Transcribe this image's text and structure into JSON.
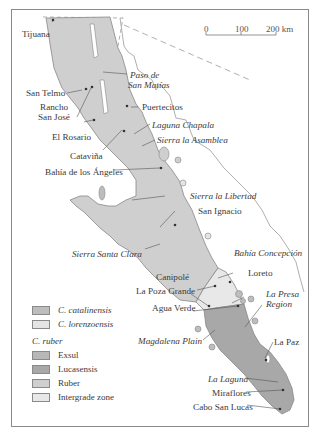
{
  "map": {
    "scale_bar": {
      "ticks": [
        "0",
        "100",
        "200 km"
      ]
    },
    "colors": {
      "catalinensis": "#bdbdbd",
      "lorenzoensis": "#e4e4e4",
      "exsul": "#b7b7b7",
      "lucasensis": "#a8a8a8",
      "ruber": "#cfcfcf",
      "intergrade": "#e8e8e8",
      "land_other": "#ffffff",
      "outline": "#888888"
    },
    "place_labels": [
      {
        "id": "tijuana",
        "text": "Tijuana",
        "italic": false
      },
      {
        "id": "paso-de-san-matias",
        "text": "Paso de San Matías",
        "line1": "Paso de",
        "line2": "San Matías",
        "italic": true
      },
      {
        "id": "san-telmo",
        "text": "San Telmo",
        "italic": false
      },
      {
        "id": "rancho-san-jose",
        "text": "Rancho San José",
        "line1": "Rancho",
        "line2": "San José",
        "italic": false
      },
      {
        "id": "puertecitos",
        "text": "Puertecitos",
        "italic": false
      },
      {
        "id": "laguna-chapala",
        "text": "Laguna Chapala",
        "italic": true
      },
      {
        "id": "el-rosario",
        "text": "El Rosario",
        "italic": false
      },
      {
        "id": "sierra-la-asamblea",
        "text": "Sierra la Asamblea",
        "italic": true
      },
      {
        "id": "catavina",
        "text": "Cataviña",
        "italic": false
      },
      {
        "id": "bahia-de-los-angeles",
        "text": "Bahía de los Ángeles",
        "italic": false
      },
      {
        "id": "sierra-la-libertad",
        "text": "Sierra la Libertad",
        "italic": true
      },
      {
        "id": "san-ignacio",
        "text": "San Ignacio",
        "italic": false
      },
      {
        "id": "sierra-santa-clara",
        "text": "Sierra Santa Clara",
        "italic": true
      },
      {
        "id": "bahia-concepcion",
        "text": "Bahía Concepción",
        "italic": true
      },
      {
        "id": "canipole",
        "text": "Canipolé",
        "italic": false
      },
      {
        "id": "loreto",
        "text": "Loreto",
        "italic": false
      },
      {
        "id": "la-poza-grande",
        "text": "La Poza Grande",
        "italic": false
      },
      {
        "id": "la-presa-region",
        "text": "La Presa Region",
        "line1": "La Presa",
        "line2": "Region",
        "italic": true
      },
      {
        "id": "agua-verde",
        "text": "Agua Verde",
        "italic": false
      },
      {
        "id": "magdalena-plain",
        "text": "Magdalena Plain",
        "italic": true
      },
      {
        "id": "la-paz",
        "text": "La Paz",
        "italic": false
      },
      {
        "id": "la-laguna",
        "text": "La Laguna",
        "italic": true
      },
      {
        "id": "miraflores",
        "text": "Miraflores",
        "italic": false
      },
      {
        "id": "cabo-san-lucas",
        "text": "Cabo San Lucas",
        "italic": false
      }
    ]
  },
  "legend": {
    "items_top": [
      {
        "label": "C. catalinensis",
        "color": "#bdbdbd",
        "italic": true
      },
      {
        "label": "C. lorenzoensis",
        "color": "#e4e4e4",
        "italic": true
      }
    ],
    "group_title": "C. ruber",
    "items_group": [
      {
        "label": "Exsul",
        "color": "#b7b7b7"
      },
      {
        "label": "Lucasensis",
        "color": "#a8a8a8"
      },
      {
        "label": "Ruber",
        "color": "#cfcfcf"
      },
      {
        "label": "Intergrade zone",
        "color": "#e8e8e8"
      }
    ]
  }
}
